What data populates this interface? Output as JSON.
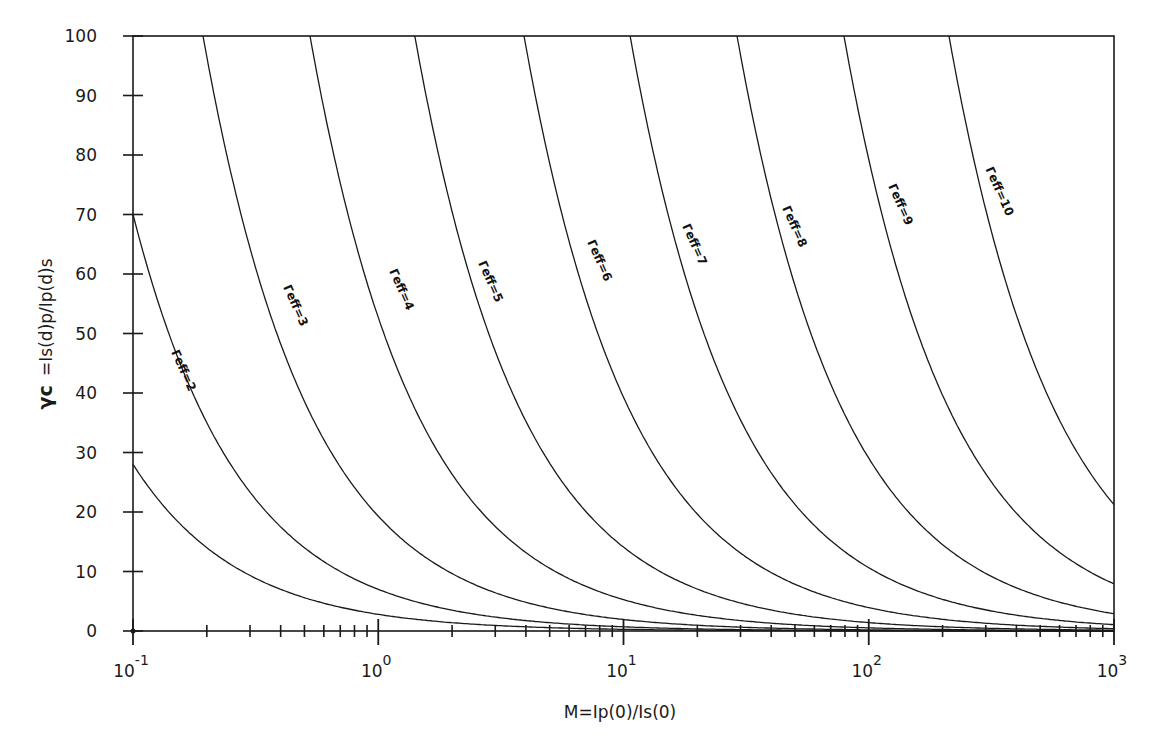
{
  "chart_data": {
    "type": "line",
    "title": "",
    "xlabel": "M=Ip(0)/Is(0)",
    "ylabel_prefix": "γc",
    "ylabel": "=Is(d)p/Ip(d)s",
    "xscale": "log",
    "xlim": [
      0.1,
      1000
    ],
    "ylim": [
      0,
      100
    ],
    "grid": false,
    "legend": "inline curve labels",
    "x_ticks": [
      {
        "base": "10",
        "exp": "-1",
        "value": 0.1
      },
      {
        "base": "10",
        "exp": "0",
        "value": 1
      },
      {
        "base": "10",
        "exp": "1",
        "value": 10
      },
      {
        "base": "10",
        "exp": "2",
        "value": 100
      },
      {
        "base": "10",
        "exp": "3",
        "value": 1000
      }
    ],
    "y_ticks": [
      "0",
      "10",
      "20",
      "30",
      "40",
      "50",
      "60",
      "70",
      "80",
      "90",
      "100"
    ],
    "x": [
      0.1,
      0.2,
      0.3,
      0.5,
      1,
      2,
      3,
      5,
      10,
      20,
      30,
      50,
      100,
      200,
      300,
      500,
      1000
    ],
    "series": [
      {
        "name": "Γeff=1 (unlabeled)",
        "label": "",
        "coef": 2.8,
        "values": [
          28.0,
          14.0,
          9.3,
          5.6,
          2.8,
          1.4,
          0.9,
          0.6,
          0.3,
          0.1,
          0.1,
          0.1,
          0.0,
          0.0,
          0.0,
          0.0,
          0.0
        ]
      },
      {
        "name": "Γeff=2",
        "label": "Γeff=2",
        "coef": 7.0,
        "values": [
          70.0,
          35.0,
          23.3,
          14.0,
          7.0,
          3.5,
          2.3,
          1.4,
          0.7,
          0.4,
          0.2,
          0.1,
          0.1,
          0.0,
          0.0,
          0.0,
          0.0
        ]
      },
      {
        "name": "Γeff=3",
        "label": "Γeff=3",
        "coef": 19.3,
        "values": [
          null,
          96.5,
          64.3,
          38.6,
          19.3,
          9.7,
          6.4,
          3.9,
          1.9,
          1.0,
          0.6,
          0.4,
          0.2,
          0.1,
          0.1,
          0.0,
          0.0
        ]
      },
      {
        "name": "Γeff=4",
        "label": "Γeff=4",
        "coef": 52.7,
        "values": [
          null,
          null,
          null,
          null,
          52.7,
          26.4,
          17.6,
          10.5,
          5.3,
          2.6,
          1.8,
          1.1,
          0.5,
          0.3,
          0.2,
          0.1,
          0.1
        ]
      },
      {
        "name": "Γeff=5",
        "label": "Γeff=5",
        "coef": 141,
        "values": [
          null,
          null,
          null,
          null,
          null,
          70.5,
          47.0,
          28.2,
          14.1,
          7.1,
          4.7,
          2.8,
          1.4,
          0.7,
          0.5,
          0.3,
          0.1
        ]
      },
      {
        "name": "Γeff=6",
        "label": "Γeff=6",
        "coef": 393,
        "values": [
          null,
          null,
          null,
          null,
          null,
          null,
          null,
          78.6,
          39.3,
          19.7,
          13.1,
          7.9,
          3.9,
          2.0,
          1.3,
          0.8,
          0.4
        ]
      },
      {
        "name": "Γeff=7",
        "label": "Γeff=7",
        "coef": 1064,
        "values": [
          null,
          null,
          null,
          null,
          null,
          null,
          null,
          null,
          null,
          53.2,
          35.5,
          21.3,
          10.6,
          5.3,
          3.5,
          2.1,
          1.1
        ]
      },
      {
        "name": "Γeff=8",
        "label": "Γeff=8",
        "coef": 2904,
        "values": [
          null,
          null,
          null,
          null,
          null,
          null,
          null,
          null,
          null,
          null,
          96.8,
          58.1,
          29.0,
          14.5,
          9.7,
          5.8,
          2.9
        ]
      },
      {
        "name": "Γeff=9",
        "label": "Γeff=9",
        "coef": 7925,
        "values": [
          null,
          null,
          null,
          null,
          null,
          null,
          null,
          null,
          null,
          null,
          null,
          null,
          79.3,
          39.6,
          26.4,
          15.9,
          7.9
        ]
      },
      {
        "name": "Γeff=10",
        "label": "Γeff=10",
        "coef": 21240,
        "values": [
          null,
          null,
          null,
          null,
          null,
          null,
          null,
          null,
          null,
          null,
          null,
          null,
          null,
          null,
          70.8,
          42.5,
          23.0
        ]
      }
    ],
    "label_positions": [
      null,
      {
        "x": 180,
        "y": 372
      },
      {
        "x": 292,
        "y": 307
      },
      {
        "x": 398,
        "y": 291
      },
      {
        "x": 487,
        "y": 283
      },
      {
        "x": 596,
        "y": 262
      },
      {
        "x": 691,
        "y": 246
      },
      {
        "x": 791,
        "y": 228
      },
      {
        "x": 897,
        "y": 206
      },
      {
        "x": 996,
        "y": 193
      }
    ]
  },
  "layout": {
    "plot_left": 133,
    "plot_right": 1114,
    "plot_top": 36,
    "plot_bottom": 631,
    "line_color": "#1a1a1a"
  }
}
